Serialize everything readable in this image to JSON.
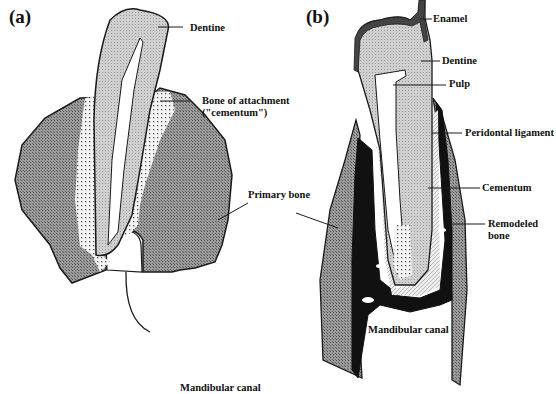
{
  "panels": [
    {
      "id": "a",
      "label": "(a)",
      "labels": {
        "dentine": "Dentine",
        "bone_attachment_line1": "Bone of attachment",
        "bone_attachment_line2": "(\"cementum\")",
        "primary_bone": "Primary bone",
        "mandibular_canal": "Mandibular canal"
      }
    },
    {
      "id": "b",
      "label": "(b)",
      "labels": {
        "enamel": "Enamel",
        "dentine": "Dentine",
        "pulp": "Pulp",
        "periodontal_ligament": "Peridontal ligament",
        "cementum": "Cementum",
        "remodeled_bone_line1": "Remodeled",
        "remodeled_bone_line2": "bone",
        "mandibular_canal": "Mandibular canal"
      }
    }
  ],
  "colors": {
    "primary_bone": "#8a8a8a",
    "dentine": "#c4c4c4",
    "remodeled_bone": "#111111",
    "cementum_stipple": "#ffffff",
    "outline": "#1a1a1a"
  }
}
